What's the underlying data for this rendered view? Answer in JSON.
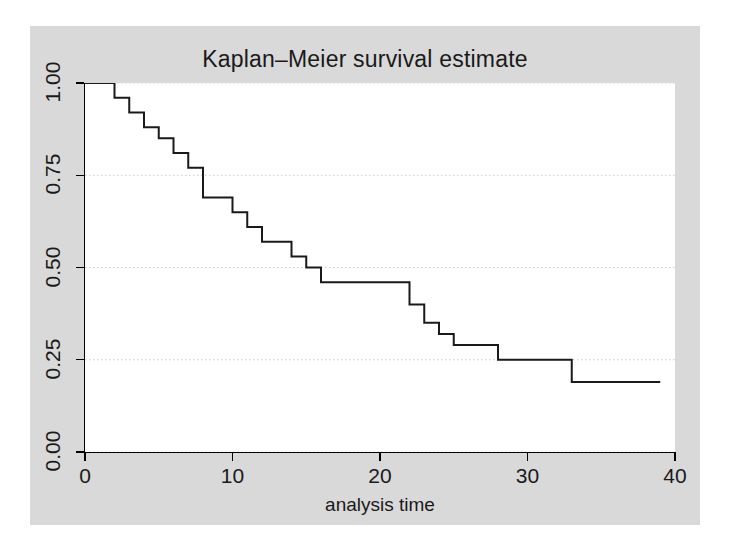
{
  "chart_data": {
    "type": "line",
    "subtype": "step-kaplan-meier",
    "title": "Kaplan–Meier survival estimate",
    "xlabel": "analysis time",
    "ylabel": "",
    "xlim": [
      0,
      40
    ],
    "ylim": [
      0,
      1
    ],
    "xticks": [
      0,
      10,
      20,
      30,
      40
    ],
    "xtick_labels": [
      "0",
      "10",
      "20",
      "30",
      "40"
    ],
    "yticks": [
      0.0,
      0.25,
      0.5,
      0.75,
      1.0
    ],
    "ytick_labels": [
      "0.00",
      "0.25",
      "0.50",
      "0.75",
      "1.00"
    ],
    "grid": {
      "horizontal": true,
      "vertical": false,
      "style": "dotted",
      "color": "#c8c8c8"
    },
    "legend": null,
    "annotations": [],
    "series": [
      {
        "name": "Survivor function",
        "color": "#1a1a1a",
        "line_width": 2,
        "step": "post",
        "x": [
          0,
          1,
          2,
          3,
          4,
          5,
          6,
          7,
          8,
          8,
          10,
          11,
          12,
          13,
          14,
          15,
          16,
          17,
          22,
          23,
          24,
          25,
          26,
          28,
          33,
          39
        ],
        "y": [
          1.0,
          1.0,
          0.96,
          0.92,
          0.88,
          0.85,
          0.81,
          0.77,
          0.77,
          0.69,
          0.69,
          0.65,
          0.61,
          0.57,
          0.57,
          0.53,
          0.5,
          0.46,
          0.46,
          0.4,
          0.35,
          0.32,
          0.29,
          0.25,
          0.19,
          0.19
        ],
        "points": [
          {
            "time": 0,
            "survival": 1.0
          },
          {
            "time": 1,
            "survival": 1.0
          },
          {
            "time": 2,
            "survival": 0.96
          },
          {
            "time": 3,
            "survival": 0.92
          },
          {
            "time": 4,
            "survival": 0.88
          },
          {
            "time": 5,
            "survival": 0.85
          },
          {
            "time": 6,
            "survival": 0.81
          },
          {
            "time": 7,
            "survival": 0.77
          },
          {
            "time": 8,
            "survival": 0.69
          },
          {
            "time": 10,
            "survival": 0.65
          },
          {
            "time": 11,
            "survival": 0.61
          },
          {
            "time": 12,
            "survival": 0.57
          },
          {
            "time": 14,
            "survival": 0.53
          },
          {
            "time": 15,
            "survival": 0.5
          },
          {
            "time": 16,
            "survival": 0.46
          },
          {
            "time": 22,
            "survival": 0.4
          },
          {
            "time": 23,
            "survival": 0.35
          },
          {
            "time": 24,
            "survival": 0.32
          },
          {
            "time": 25,
            "survival": 0.29
          },
          {
            "time": 28,
            "survival": 0.25
          },
          {
            "time": 33,
            "survival": 0.19
          },
          {
            "time": 39,
            "survival": 0.19
          }
        ]
      }
    ]
  },
  "style": {
    "outer_background": "#ffffff",
    "graph_region_background": "#d9d9d9",
    "plot_region_background": "#ffffff",
    "axis_color": "#000000",
    "text_color": "#1a1a1a",
    "curve_color": "#1a1a1a",
    "gridline_color": "#c8c8c8"
  }
}
